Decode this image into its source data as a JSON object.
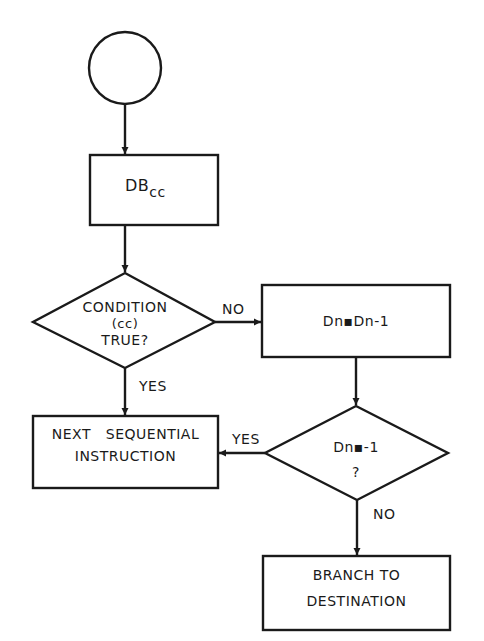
{
  "diagram": {
    "type": "flowchart",
    "colors": {
      "stroke": "#1a1a1a",
      "background": "#ffffff",
      "text": "#1a1a1a"
    },
    "nodes": {
      "start": {
        "shape": "circle",
        "label": ""
      },
      "dbcc": {
        "shape": "process",
        "label_main": "DB",
        "label_sub": "cc"
      },
      "condition": {
        "shape": "decision",
        "line1": "CONDITION",
        "line2": "(cc)",
        "line3": "TRUE?"
      },
      "decrement": {
        "shape": "process",
        "label": "Dn▪Dn-1"
      },
      "test_minus_one": {
        "shape": "decision",
        "line1": "Dn▪-1",
        "line2": "?"
      },
      "next_instruction": {
        "shape": "process",
        "line1": "NEXT   SEQUENTIAL",
        "line2": "INSTRUCTION"
      },
      "branch": {
        "shape": "process",
        "line1": "BRANCH TO",
        "line2": "DESTINATION"
      }
    },
    "edges": [
      {
        "from": "start",
        "to": "dbcc",
        "label": ""
      },
      {
        "from": "dbcc",
        "to": "condition",
        "label": ""
      },
      {
        "from": "condition",
        "to": "decrement",
        "label": "NO"
      },
      {
        "from": "condition",
        "to": "next_instruction",
        "label": "YES"
      },
      {
        "from": "decrement",
        "to": "test_minus_one",
        "label": ""
      },
      {
        "from": "test_minus_one",
        "to": "next_instruction",
        "label": "YES"
      },
      {
        "from": "test_minus_one",
        "to": "branch",
        "label": "NO"
      }
    ],
    "edge_labels": {
      "cond_no": "NO",
      "cond_yes": "YES",
      "test_yes": "YES",
      "test_no": "NO"
    }
  }
}
